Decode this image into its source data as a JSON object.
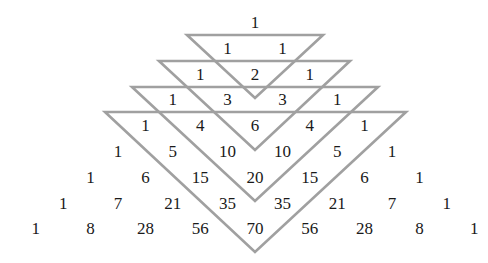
{
  "diagram": {
    "line_color": "#a0a0a0",
    "text_color": "#1a1a1a",
    "rows": [
      [
        "1"
      ],
      [
        "1",
        "1"
      ],
      [
        "1",
        "2",
        "1"
      ],
      [
        "1",
        "3",
        "3",
        "1"
      ],
      [
        "1",
        "4",
        "6",
        "4",
        "1"
      ],
      [
        "1",
        "5",
        "10",
        "10",
        "5",
        "1"
      ],
      [
        "1",
        "6",
        "15",
        "20",
        "15",
        "6",
        "1"
      ],
      [
        "1",
        "7",
        "21",
        "35",
        "35",
        "21",
        "7",
        "1"
      ],
      [
        "1",
        "8",
        "28",
        "56",
        "70",
        "56",
        "28",
        "8",
        "1"
      ]
    ],
    "triangles": [
      {
        "top_y": 35,
        "left_x": 187,
        "right_x": 323,
        "apex_x": 255,
        "apex_y": 98
      },
      {
        "top_y": 61,
        "left_x": 159,
        "right_x": 350,
        "apex_x": 255,
        "apex_y": 150
      },
      {
        "top_y": 87,
        "left_x": 132,
        "right_x": 378,
        "apex_x": 255,
        "apex_y": 201
      },
      {
        "top_y": 112,
        "left_x": 105,
        "right_x": 406,
        "apex_x": 255,
        "apex_y": 252
      }
    ],
    "layout": {
      "center_x": 255,
      "first_row_y": 22,
      "row_spacing": 25.8,
      "col_spacing": 27.4
    }
  }
}
